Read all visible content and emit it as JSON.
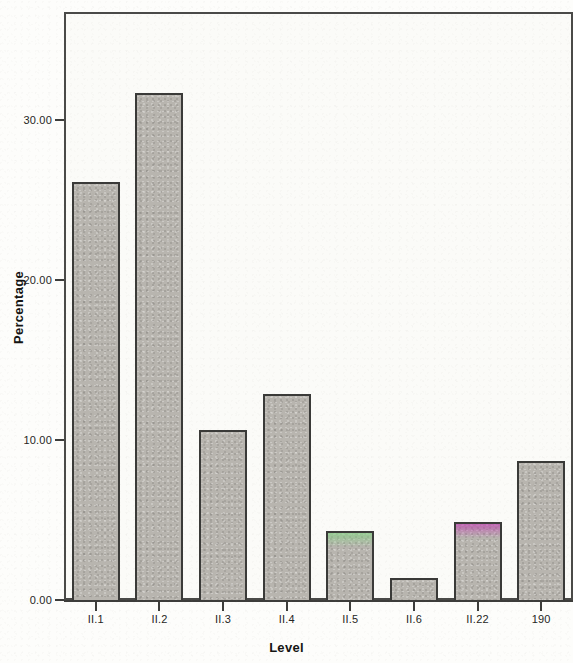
{
  "chart_data": {
    "type": "bar",
    "title": "",
    "subtitle": "",
    "xlabel": "Level",
    "ylabel": "Percentage",
    "categories": [
      "II.1",
      "II.2",
      "II.3",
      "II.4",
      "II.5",
      "II.6",
      "II.22",
      "190"
    ],
    "values": [
      26.1,
      31.7,
      10.6,
      12.9,
      4.3,
      1.4,
      4.9,
      8.7
    ],
    "ylim": [
      0,
      36
    ],
    "ytick_labels": [
      "0.00",
      "10.00",
      "20.00",
      "30.00"
    ],
    "ytick_values": [
      0,
      10,
      20,
      30
    ],
    "grid": false,
    "legend": null,
    "bar_fill_color": "#b8b5af",
    "bar_border_color": "#3a3a38",
    "plot_background_color": "#fbfbf8",
    "axis_color": "#3d3d3b",
    "text_color": "#262624",
    "artifacts": [
      {
        "category": "II.5",
        "color": "#7fd67f",
        "note": "green scan fringe at bar top"
      },
      {
        "category": "II.22",
        "color": "#c22fb0",
        "note": "magenta scan fringe at bar top"
      }
    ]
  }
}
